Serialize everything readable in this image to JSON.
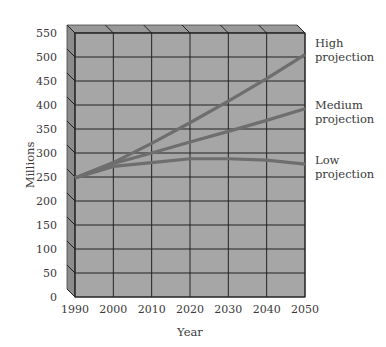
{
  "chart_data": {
    "type": "line",
    "title": "",
    "xlabel": "Year",
    "ylabel": "Millions",
    "x": [
      1990,
      2000,
      2010,
      2020,
      2030,
      2040,
      2050
    ],
    "x_tick_labels": [
      "1990",
      "2000",
      "2010",
      "2020",
      "2030",
      "2040",
      "2050"
    ],
    "y_tick_labels": [
      "0",
      "50",
      "100",
      "150",
      "200",
      "250",
      "300",
      "350",
      "400",
      "450",
      "500",
      "550"
    ],
    "ylim": [
      0,
      550
    ],
    "grid": true,
    "style": "3d-box",
    "legend_position": "right, inline labels at line ends",
    "series": [
      {
        "name": "High projection",
        "label_lines": [
          "High",
          "projection"
        ],
        "values": [
          248,
          280,
          320,
          363,
          408,
          455,
          505
        ]
      },
      {
        "name": "Medium projection",
        "label_lines": [
          "Medium",
          "projection"
        ],
        "values": [
          248,
          278,
          300,
          323,
          345,
          368,
          392
        ]
      },
      {
        "name": "Low projection",
        "label_lines": [
          "Low",
          "projection"
        ],
        "values": [
          248,
          272,
          280,
          288,
          288,
          285,
          277
        ]
      }
    ],
    "colors": {
      "plot_face": "#a6a6a6",
      "side_face": "#8c8c8c",
      "top_face": "#999999",
      "grid": "#222222",
      "line": "#6e6e6e"
    }
  }
}
